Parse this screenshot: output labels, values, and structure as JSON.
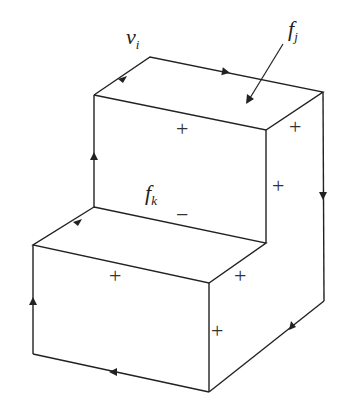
{
  "diagram": {
    "type": "oriented boundary of staircase solid",
    "labels": {
      "vertex": "v",
      "vertex_sub": "i",
      "face_j": "f",
      "face_j_sub": "j",
      "face_k": "f",
      "face_k_sub": "k"
    },
    "signs": {
      "top_face": "+",
      "top_right_face": "+",
      "upper_side": "+",
      "inner_riser": "−",
      "lower_top": "+",
      "lower_right_top": "+",
      "front_right": "+"
    },
    "colors": {
      "line": "#222222",
      "background": "#ffffff"
    }
  }
}
